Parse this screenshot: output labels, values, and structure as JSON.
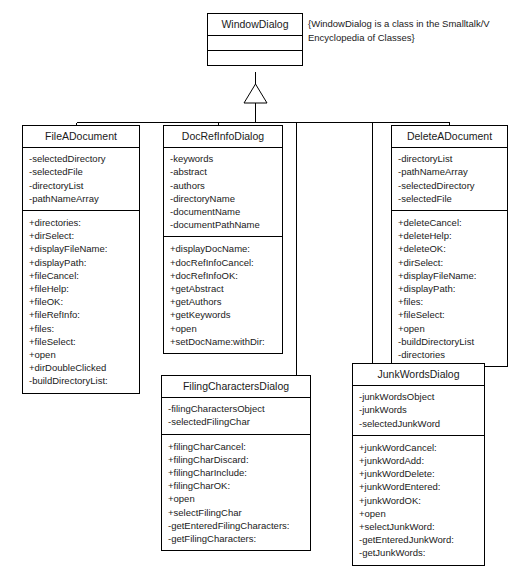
{
  "diagram": {
    "type": "uml-class-diagram",
    "relationship": "generalization"
  },
  "note": {
    "name": "windowdialog-note",
    "lines": [
      "{WindowDialog is a class in the Smalltalk/V",
      "Encyclopedia of Classes}"
    ]
  },
  "classes": {
    "windowdialog": {
      "name": "WindowDialog",
      "attributes": [],
      "operations": []
    },
    "fileadocument": {
      "name": "FileADocument",
      "attributes": [
        "-selectedDirectory",
        "-selectedFile",
        "-directoryList",
        "-pathNameArray"
      ],
      "operations": [
        "+directories:",
        "+dirSelect:",
        "+displayFileName:",
        "+displayPath:",
        "+fileCancel:",
        "+fileHelp:",
        "+fileOK:",
        "+fileRefInfo:",
        "+files:",
        "+fileSelect:",
        "+open",
        "+dirDoubleClicked",
        "-buildDirectoryList:"
      ]
    },
    "docrefinfodialog": {
      "name": "DocRefInfoDialog",
      "attributes": [
        "-keywords",
        "-abstract",
        "-authors",
        "-directoryName",
        "-documentName",
        "-documentPathName"
      ],
      "operations": [
        "+displayDocName:",
        "+docRefInfoCancel:",
        "+docRefInfoOK:",
        "+getAbstract",
        "+getAuthors",
        "+getKeywords",
        "+open",
        "+setDocName:withDir:"
      ]
    },
    "deleteadocument": {
      "name": "DeleteADocument",
      "attributes": [
        "-directoryList",
        "-pathNameArray",
        "-selectedDirectory",
        "-selectedFile"
      ],
      "operations": [
        "+deleteCancel:",
        "+deleteHelp:",
        "+deleteOK:",
        "+dirSelect:",
        "+displayFileName:",
        "+displayPath:",
        "+files:",
        "+fileSelect:",
        "+open",
        "-buildDirectoryList",
        "-directories"
      ]
    },
    "filingcharactersdialog": {
      "name": "FilingCharactersDialog",
      "attributes": [
        "-filingCharactersObject",
        "-selectedFilingChar"
      ],
      "operations": [
        "+filingCharCancel:",
        "+filingCharDiscard:",
        "+filingCharInclude:",
        "+filingCharOK:",
        "+open",
        "+selectFilingChar",
        "-getEnteredFilingCharacters:",
        "-getFilingCharacters:"
      ]
    },
    "junkwordsdialog": {
      "name": "JunkWordsDialog",
      "attributes": [
        "-junkWordsObject",
        "-junkWords",
        "-selectedJunkWord"
      ],
      "operations": [
        "+junkWordCancel:",
        "+junkWordAdd:",
        "+junkWordDelete:",
        "+junkWordEntered:",
        "+junkWordOK:",
        "+open",
        "+selectJunkWord:",
        "-getEnteredJunkWord:",
        "-getJunkWords:"
      ]
    }
  },
  "colors": {
    "line": "#000000",
    "box_fill": "#ffffff",
    "text": "#1a1a1a",
    "background": "#ffffff"
  }
}
